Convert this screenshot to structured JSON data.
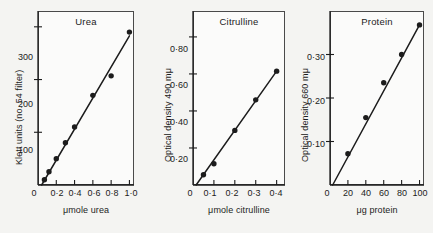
{
  "figure": {
    "background_color": "#f4f4f2",
    "ink_color": "#1c1c1c"
  },
  "chart_data": [
    {
      "type": "scatter",
      "title": "Urea",
      "xlabel": "μmole urea",
      "ylabel": "Klett units (no. 54 filter)",
      "xlim": [
        0,
        1.05
      ],
      "ylim": [
        0,
        330
      ],
      "grid": false,
      "legend": "none",
      "xticks": [
        0,
        0.2,
        0.4,
        0.6,
        0.8,
        1.0
      ],
      "xtick_labels": [
        "0",
        "0·2",
        "0·4",
        "0·6",
        "0·8",
        "1·0"
      ],
      "yticks": [
        100,
        200,
        300
      ],
      "ytick_labels": [
        "100",
        "200",
        "300"
      ],
      "x": [
        0.07,
        0.12,
        0.2,
        0.3,
        0.4,
        0.6,
        0.8,
        1.0
      ],
      "y": [
        10,
        25,
        50,
        80,
        110,
        170,
        207,
        290
      ],
      "fit_line": {
        "x": [
          0.04,
          1.0
        ],
        "y": [
          0,
          283
        ]
      }
    },
    {
      "type": "scatter",
      "title": "Citrulline",
      "xlabel": "μmole citrulline",
      "ylabel": "Optical density 490 mμ",
      "xlim": [
        0,
        0.44
      ],
      "ylim": [
        0,
        0.94
      ],
      "grid": false,
      "legend": "none",
      "xticks": [
        0,
        0.1,
        0.2,
        0.3,
        0.4
      ],
      "xtick_labels": [
        "0",
        "0·1",
        "0·2",
        "0·3",
        "0·4"
      ],
      "yticks": [
        0.2,
        0.4,
        0.6,
        0.8
      ],
      "ytick_labels": [
        "0·20",
        "0·40",
        "0·60",
        "0·80"
      ],
      "x": [
        0.05,
        0.1,
        0.2,
        0.3,
        0.4
      ],
      "y": [
        0.055,
        0.115,
        0.295,
        0.46,
        0.615
      ],
      "fit_line": {
        "x": [
          0.015,
          0.4
        ],
        "y": [
          0,
          0.615
        ]
      }
    },
    {
      "type": "scatter",
      "title": "Protein",
      "xlabel": "μg protein",
      "ylabel": "Optical density 660 mμ",
      "xlim": [
        0,
        105
      ],
      "ylim": [
        0,
        0.4
      ],
      "grid": false,
      "legend": "none",
      "xticks": [
        0,
        20,
        40,
        60,
        80,
        100
      ],
      "xtick_labels": [
        "0",
        "20",
        "40",
        "60",
        "80",
        "100"
      ],
      "yticks": [
        0.1,
        0.2,
        0.3
      ],
      "ytick_labels": [
        "0·10",
        "0·20",
        "0·30"
      ],
      "x": [
        20,
        40,
        60,
        80,
        100
      ],
      "y": [
        0.072,
        0.155,
        0.235,
        0.3,
        0.368
      ],
      "fit_line": {
        "x": [
          3,
          100
        ],
        "y": [
          0,
          0.368
        ]
      }
    }
  ]
}
